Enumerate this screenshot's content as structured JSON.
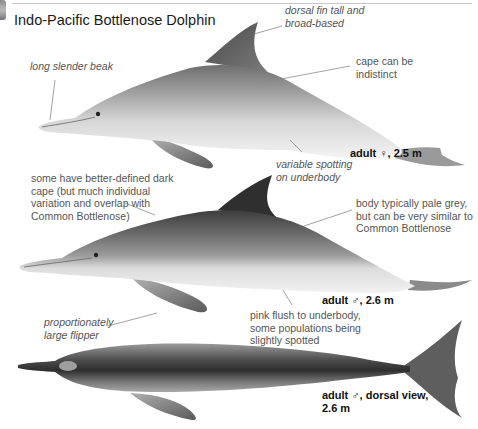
{
  "page": {
    "title": "Indo-Pacific Bottlenose Dolphin"
  },
  "annotations": {
    "dorsal_fin": "dorsal fin tall and broad-based",
    "dorsal_fin_lines": [
      "dorsal fin tall and",
      "broad-based"
    ],
    "long_beak": "long slender beak",
    "cape_indistinct_lines": [
      "cape can be",
      "indistinct"
    ],
    "spotting_lines": [
      "variable spotting",
      "on underbody"
    ],
    "dark_cape_lines": [
      "some have better-defined dark",
      "cape (but much individual",
      "variation and overlap with",
      "Common Bottlenose)"
    ],
    "body_pale_lines": [
      "body typically pale grey,",
      "but can be very similar to",
      "Common Bottlenose"
    ],
    "flipper_lines": [
      "proportionately",
      "large flipper"
    ],
    "pink_flush_lines": [
      "pink flush to underbody,",
      "some populations being",
      "slightly spotted"
    ]
  },
  "figures": [
    {
      "id": "female-lateral",
      "caption": "adult ♀, 2.5 m"
    },
    {
      "id": "male-lateral",
      "caption": "adult ♂, 2.6 m"
    },
    {
      "id": "male-dorsal",
      "caption_lines": [
        "adult ♂, dorsal view,",
        "2.6 m"
      ]
    }
  ],
  "colors": {
    "text": "#1a1a1a",
    "note_text": "#555555",
    "dark_grey": "#3a3a3a",
    "mid_grey": "#8c8c8c",
    "pale_grey": "#d9d9d9",
    "belly": "#f2f2f2"
  }
}
